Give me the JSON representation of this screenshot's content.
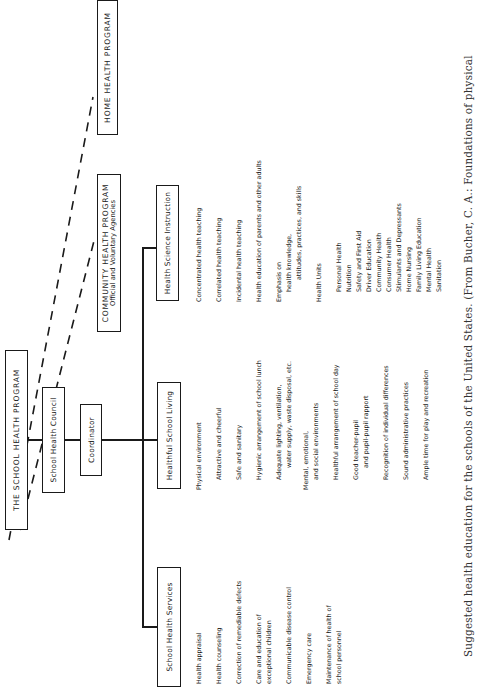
{
  "diagram": {
    "root": "THE SCHOOL HEALTH PROGRAM",
    "council": "School Health Council",
    "coordinator": "Coordinator",
    "external": {
      "community": {
        "title": "COMMUNITY HEALTH PROGRAM",
        "subtitle": "Official and Voluntary Agencies"
      },
      "home": {
        "title": "HOME HEALTH PROGRAM"
      }
    },
    "branches": {
      "services": {
        "title": "School Health Services",
        "items": [
          [
            "Health appraisal"
          ],
          [
            "Health counseling"
          ],
          [
            "Correction of remediable defects"
          ],
          [
            "Care and education of",
            "exceptional children"
          ],
          [
            "Communicable disease control"
          ],
          [
            "Emergency care"
          ],
          [
            "Maintenance of health of",
            "school personnel"
          ]
        ]
      },
      "living": {
        "title": "Healthful School Living",
        "items": {
          "physical": "Physical environment",
          "attractive": "Attractive and cheerful",
          "safe": "Safe and sanitary",
          "lunch": "Hygienic arrangement of school lunch",
          "lighting_1": "Adequate lighting, ventilation,",
          "lighting_2": "water supply, waste disposal, etc.",
          "mental_1": "Mental, emotional,",
          "mental_2": "and social environments",
          "day": "Healthful arrangement of school day",
          "rapport_1": "Good teacher-pupil",
          "rapport_2": "and pupil-pupil rapport",
          "differences": "Recognition of individual differences",
          "admin": "Sound administrative practices",
          "play": "Ample time for play and recreation"
        }
      },
      "instruction": {
        "title": "Health Science Instruction",
        "items": {
          "concentrated": "Concentrated health teaching",
          "correlated": "Correlated health teaching",
          "incidental": "Incidental health teaching",
          "adults": "Health education of parents and other adults",
          "emphasis_1": "Emphasis on",
          "emphasis_2": "health knowledge,",
          "emphasis_3": "attitudes, practices, and skills",
          "units_title": "Health Units",
          "units": [
            "Personal Health",
            "Nutrition",
            "Safety and First Aid",
            "Driver Education",
            "Community Health",
            "Consumer Health",
            "Stimulants and Depressants",
            "Home Nursing",
            "Family Living Education",
            "Mental Health",
            "Sanitation"
          ]
        }
      }
    }
  },
  "caption": "Suggested health education for the schools of the United States. (From Bucher, C. A.: Foundations of physical"
}
